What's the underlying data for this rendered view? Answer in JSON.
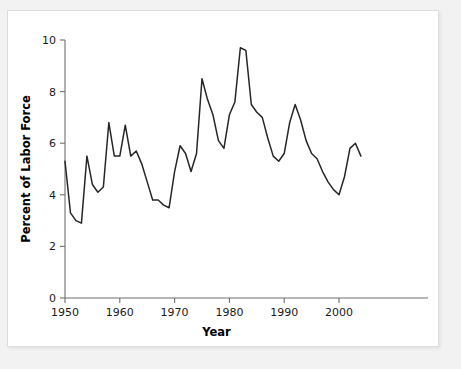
{
  "figure": {
    "background_color": "#f2f2f2",
    "panel_color": "#ffffff",
    "line_color": "#262626",
    "axis_color": "#6f6f6f"
  },
  "chart_data": {
    "type": "line",
    "title": "",
    "xlabel": "Year",
    "ylabel": "Percent of Labor Force",
    "xlim": [
      1950,
      2004
    ],
    "ylim": [
      0,
      10
    ],
    "grid": false,
    "legend": "none",
    "x_ticks": [
      1950,
      1960,
      1970,
      1980,
      1990,
      2000
    ],
    "x_tick_labels": [
      "1950",
      "1960",
      "1970",
      "1980",
      "1990",
      "2000"
    ],
    "y_ticks": [
      0,
      2,
      4,
      6,
      8,
      10
    ],
    "y_tick_labels": [
      "0",
      "2",
      "4",
      "6",
      "8",
      "10"
    ],
    "series": [
      {
        "name": "Unemployment Rate",
        "x": [
          1950,
          1951,
          1952,
          1953,
          1954,
          1955,
          1956,
          1957,
          1958,
          1959,
          1960,
          1961,
          1962,
          1963,
          1964,
          1965,
          1966,
          1967,
          1968,
          1969,
          1970,
          1971,
          1972,
          1973,
          1974,
          1975,
          1976,
          1977,
          1978,
          1979,
          1980,
          1981,
          1982,
          1983,
          1984,
          1985,
          1986,
          1987,
          1988,
          1989,
          1990,
          1991,
          1992,
          1993,
          1994,
          1995,
          1996,
          1997,
          1998,
          1999,
          2000,
          2001,
          2002,
          2003,
          2004
        ],
        "values": [
          5.3,
          3.3,
          3.0,
          2.9,
          5.5,
          4.4,
          4.1,
          4.3,
          6.8,
          5.5,
          5.5,
          6.7,
          5.5,
          5.7,
          5.2,
          4.5,
          3.8,
          3.8,
          3.6,
          3.5,
          4.9,
          5.9,
          5.6,
          4.9,
          5.6,
          8.5,
          7.7,
          7.1,
          6.1,
          5.8,
          7.1,
          7.6,
          9.7,
          9.6,
          7.5,
          7.2,
          7.0,
          6.2,
          5.5,
          5.3,
          5.6,
          6.8,
          7.5,
          6.9,
          6.1,
          5.6,
          5.4,
          4.9,
          4.5,
          4.2,
          4.0,
          4.7,
          5.8,
          6.0,
          5.5
        ]
      }
    ]
  }
}
